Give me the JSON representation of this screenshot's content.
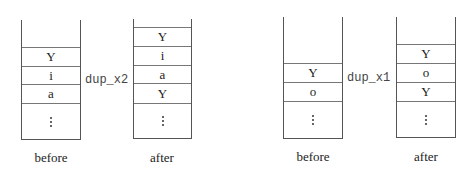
{
  "diagrams": [
    {
      "operation": "dup_x2",
      "before": {
        "label": "before",
        "cells": [
          "Y",
          "i",
          "a"
        ]
      },
      "after": {
        "label": "after",
        "cells": [
          "Y",
          "i",
          "a",
          "Y"
        ]
      }
    },
    {
      "operation": "dup_x1",
      "before": {
        "label": "before",
        "cells": [
          "Y",
          "o"
        ]
      },
      "after": {
        "label": "after",
        "cells": [
          "Y",
          "o",
          "Y"
        ]
      }
    }
  ],
  "continuation_symbol": "⋮"
}
